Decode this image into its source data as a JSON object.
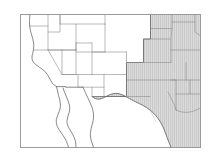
{
  "figure": {
    "name": "us-western-states-thematic-map",
    "background_color": "#ffffff",
    "frame": {
      "visible": true,
      "stroke_color": "#9a9a9a",
      "stroke_width": 1,
      "x": 20.5,
      "y": 14.5,
      "width": 180,
      "height": 133
    },
    "styles": {
      "state_border_color": "#8c8c8c",
      "state_border_width": 0.6,
      "region_outline_color": "#6b6b6b",
      "region_outline_width": 0.9,
      "coastline_color": "#6b6b6b",
      "coastline_width": 0.8,
      "unshaded_fill": "#ffffff",
      "shaded_fill": "#dcdcdc",
      "hatch_line_color": "#c2c2c2",
      "hatch_spacing": 2,
      "hatch_orientation": "vertical"
    },
    "legend": {
      "visible": false,
      "entries": []
    },
    "labels": {
      "visible": false,
      "entries": []
    },
    "title": "",
    "shaded_region_name": "highlighted-states",
    "unshaded_region_name": "unhighlighted-states"
  }
}
